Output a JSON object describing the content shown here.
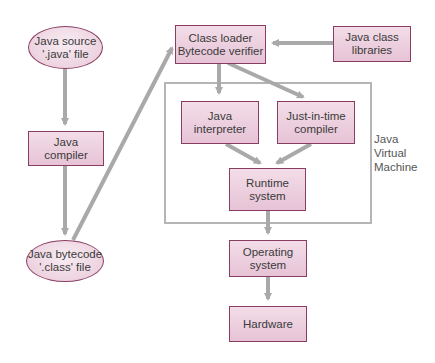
{
  "diagram": {
    "nodes": {
      "java_source": {
        "line1": "Java source",
        "line2": "'.java' file",
        "shape": "ellipse"
      },
      "java_compiler": {
        "line1": "Java",
        "line2": "compiler",
        "shape": "box"
      },
      "java_bytecode": {
        "line1": "Java bytecode",
        "line2": "'.class' file",
        "shape": "ellipse"
      },
      "class_loader": {
        "line1": "Class loader",
        "line2": "Bytecode verifier",
        "shape": "box"
      },
      "java_class_libraries": {
        "line1": "Java class",
        "line2": "libraries",
        "shape": "box"
      },
      "java_interpreter": {
        "line1": "Java",
        "line2": "interpreter",
        "shape": "box"
      },
      "jit_compiler": {
        "line1": "Just-in-time",
        "line2": "compiler",
        "shape": "box"
      },
      "runtime_system": {
        "line1": "Runtime",
        "line2": "system",
        "shape": "box"
      },
      "operating_system": {
        "line1": "Operating",
        "line2": "system",
        "shape": "box"
      },
      "hardware": {
        "line1": "Hardware",
        "shape": "box"
      }
    },
    "group": {
      "jvm": {
        "line1": "Java",
        "line2": "Virtual",
        "line3": "Machine"
      }
    },
    "edges": [
      {
        "from": "java_source",
        "to": "java_compiler"
      },
      {
        "from": "java_compiler",
        "to": "java_bytecode"
      },
      {
        "from": "java_bytecode",
        "to": "class_loader"
      },
      {
        "from": "java_class_libraries",
        "to": "class_loader"
      },
      {
        "from": "class_loader",
        "to": "java_interpreter"
      },
      {
        "from": "class_loader",
        "to": "jit_compiler"
      },
      {
        "from": "java_interpreter",
        "to": "runtime_system"
      },
      {
        "from": "jit_compiler",
        "to": "runtime_system"
      },
      {
        "from": "runtime_system",
        "to": "operating_system"
      },
      {
        "from": "operating_system",
        "to": "hardware"
      }
    ],
    "colors": {
      "node_fill": "#e9cadb",
      "node_border": "#8a3d62",
      "arrow": "#a9a9a9",
      "frame": "#b5b5b5",
      "text": "#3a3a3a"
    }
  }
}
